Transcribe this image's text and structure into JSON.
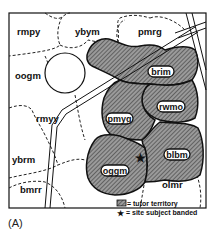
{
  "figure": {
    "caption": "(A)",
    "territories": [
      {
        "id": "rmpy",
        "label": "rmpy",
        "tutor": false
      },
      {
        "id": "ybym",
        "label": "ybym",
        "tutor": false
      },
      {
        "id": "pmrg",
        "label": "pmrg",
        "tutor": false
      },
      {
        "id": "oogm",
        "label": "oogm",
        "tutor": false
      },
      {
        "id": "rmyy",
        "label": "rmyy",
        "tutor": false
      },
      {
        "id": "ybrm",
        "label": "ybrm",
        "tutor": false
      },
      {
        "id": "bmrr",
        "label": "bmrr",
        "tutor": false
      },
      {
        "id": "olmr",
        "label": "olmr",
        "tutor": false
      },
      {
        "id": "brim",
        "label": "brim",
        "tutor": true
      },
      {
        "id": "rwmo",
        "label": "rwmo",
        "tutor": true
      },
      {
        "id": "pmyg",
        "label": "pmyg",
        "tutor": true
      },
      {
        "id": "oggm",
        "label": "oggm",
        "tutor": true
      },
      {
        "id": "blbm",
        "label": "blbm",
        "tutor": true
      }
    ],
    "legend": {
      "tutor_territory": "= tutor territory",
      "site_subject_banded": "= site subject banded"
    },
    "colors": {
      "hatch_fill": "#8a8a8a",
      "ink": "#111111"
    }
  }
}
